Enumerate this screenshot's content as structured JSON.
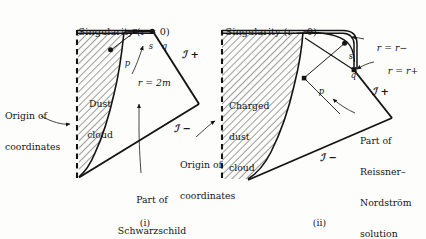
{
  "figure": {
    "background_color": "#fdfdfc",
    "ink_color": "#141414",
    "panels": [
      {
        "key": "i",
        "caption": "(i)",
        "title": "Singularity (r = 0)",
        "region_label_line1": "Dust",
        "region_label_line2": "cloud",
        "horizon_label": "r = 2m",
        "origin_label_line1": "Origin of",
        "origin_label_line2": "coordinates",
        "exterior_label_line1": "Part of",
        "exterior_label_line2": "Schwarzschild",
        "exterior_label_line3": "solution",
        "scri_plus": "ℐ +",
        "scri_minus": "ℐ −",
        "points": [
          "p",
          "s",
          "q"
        ]
      },
      {
        "key": "ii",
        "caption": "(ii)",
        "title": "Singularity (r = 0)",
        "region_label_line1": "Charged",
        "region_label_line2": "dust",
        "region_label_line3": "cloud",
        "inner_horizon_label": "r = r−",
        "outer_horizon_label": "r = r+",
        "origin_label_line1": "Origin of",
        "origin_label_line2": "coordinates",
        "exterior_label_line1": "Part of",
        "exterior_label_line2": "Reissner–",
        "exterior_label_line3": "Nordström",
        "exterior_label_line4": "solution",
        "scri_plus": "ℐ +",
        "scri_minus": "ℐ −",
        "points": [
          "p",
          "s",
          "q"
        ]
      }
    ]
  }
}
